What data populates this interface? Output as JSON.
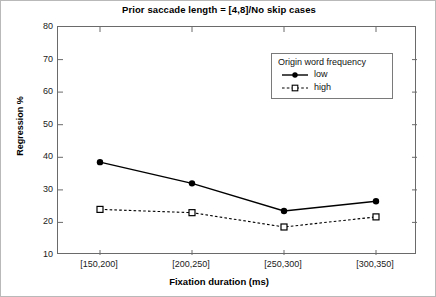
{
  "chart_data": {
    "type": "line",
    "title": "Prior saccade length = [4,8]/No skip cases",
    "xlabel": "Fixation duration (ms)",
    "ylabel": "Regression %",
    "categories": [
      "[150,200]",
      "[200,250]",
      "[250,300]",
      "[300,350]"
    ],
    "ylim": [
      10,
      80
    ],
    "yticks": [
      "80",
      "70",
      "60",
      "50",
      "40",
      "30",
      "20",
      "10"
    ],
    "ytick_values": [
      80,
      70,
      60,
      50,
      40,
      30,
      20,
      10
    ],
    "grid": false,
    "legend_position": "upper-right-inside",
    "legend_title": "Origin word frequency",
    "series": [
      {
        "name": "low",
        "values": [
          38.5,
          32.0,
          23.5,
          26.5
        ],
        "line_style": "solid",
        "marker": "filled-circle",
        "color": "#000000"
      },
      {
        "name": "high",
        "values": [
          24.0,
          23.0,
          18.6,
          21.7
        ],
        "line_style": "dashed",
        "marker": "open-square",
        "color": "#000000"
      }
    ]
  }
}
